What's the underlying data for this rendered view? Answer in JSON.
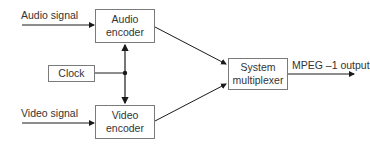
{
  "diagram": {
    "type": "block-diagram",
    "inputs": {
      "audio_signal": "Audio signal",
      "video_signal": "Video signal"
    },
    "blocks": {
      "audio_encoder": {
        "line1": "Audio",
        "line2": "encoder"
      },
      "video_encoder": {
        "line1": "Video",
        "line2": "encoder"
      },
      "clock": {
        "label": "Clock"
      },
      "system_multiplexer": {
        "line1": "System",
        "line2": "multiplexer"
      }
    },
    "output": {
      "label": "MPEG –1 output"
    },
    "colors": {
      "line": "#1a1a1a",
      "box_border": "#7a7a7a",
      "text": "#333333"
    }
  }
}
